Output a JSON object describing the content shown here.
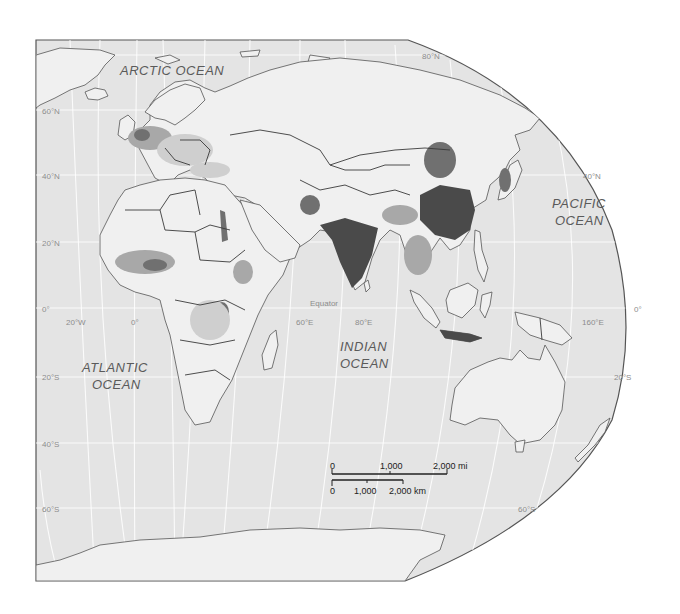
{
  "map": {
    "title": "",
    "projection": "Eastern hemisphere, population density (grayscale)",
    "colors": {
      "ocean": "#e4e4e4",
      "land": "#f0f0f0",
      "border": "#3a3a3a",
      "graticule": "#ffffff",
      "frame": "#555555",
      "density_low": "#cfcfcf",
      "density_mid": "#a8a8a8",
      "density_high": "#707070",
      "density_very_high": "#4a4a4a"
    },
    "ocean_labels": {
      "arctic": "ARCTIC  OCEAN",
      "pacific_line1": "PACIFIC",
      "pacific_line2": "OCEAN",
      "atlantic_line1": "ATLANTIC",
      "atlantic_line2": "OCEAN",
      "indian_line1": "INDIAN",
      "indian_line2": "OCEAN"
    },
    "graticule_labels": {
      "lat_80n": "80°N",
      "lat_60n": "60°N",
      "lat_40n_left": "40°N",
      "lat_40n_right": "40°N",
      "lat_20n": "20°N",
      "lat_0_left": "0°",
      "lat_0_right": "0°",
      "equator": "Equator",
      "lat_20s_left": "20°S",
      "lat_20s_right": "20°S",
      "lat_40s": "40°S",
      "lat_60s_left": "60°S",
      "lat_60s_right": "60°S",
      "lon_20w": "20°W",
      "lon_0": "0°",
      "lon_60e": "60°E",
      "lon_80e": "80°E",
      "lon_160e": "160°E"
    },
    "scale_bar": {
      "mi_labels": [
        "0",
        "1,000",
        "2,000 mi"
      ],
      "km_labels": [
        "0",
        "1,000",
        "2,000 km"
      ]
    }
  }
}
